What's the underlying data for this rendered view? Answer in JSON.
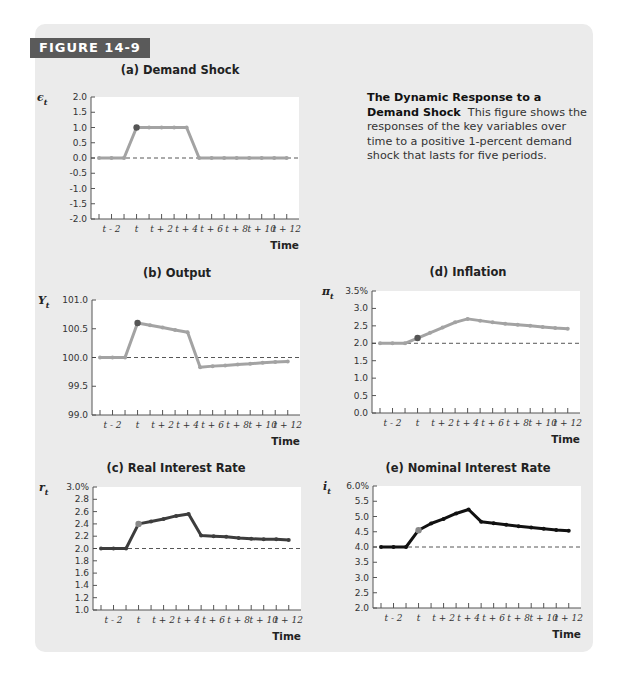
{
  "figure": {
    "label": "FIGURE 14-9",
    "caption_title": "The Dynamic Response to a Demand Shock",
    "caption_body": "This figure shows the responses of the key variables over time to a positive 1-percent demand shock that lasts for five periods."
  },
  "colors": {
    "panel_bg": "#ebebeb",
    "plot_bg": "#ffffff",
    "label_bg": "#5a5a5a",
    "light_series": "#a3a3a3",
    "mid_series": "#3d3d3d",
    "dark_series": "#111111",
    "shock_marker": "#555555"
  },
  "chart_data": [
    {
      "id": "a",
      "type": "line",
      "title": "(a) Demand Shock",
      "ylabel": "ε_t",
      "xlabel": "Time",
      "x": [
        -3,
        -2,
        -1,
        0,
        1,
        2,
        3,
        4,
        5,
        6,
        7,
        8,
        9,
        10,
        11,
        12
      ],
      "x_tick_labels": [
        "t - 2",
        "t",
        "t + 2",
        "t + 4",
        "t + 6",
        "t + 8",
        "t + 10",
        "t + 12"
      ],
      "y_ticks": [
        "2.0",
        "1.5",
        "1.0",
        "0.5",
        "0.0",
        "-0.5",
        "-1.0",
        "-1.5",
        "-2.0"
      ],
      "ylim": [
        -2.0,
        2.0
      ],
      "baseline": 0.0,
      "values": [
        0,
        0,
        0,
        1,
        1,
        1,
        1,
        1,
        0,
        0,
        0,
        0,
        0,
        0,
        0,
        0
      ],
      "style": "light"
    },
    {
      "id": "b",
      "type": "line",
      "title": "(b) Output",
      "ylabel": "Y_t",
      "xlabel": "Time",
      "x": [
        -3,
        -2,
        -1,
        0,
        1,
        2,
        3,
        4,
        5,
        6,
        7,
        8,
        9,
        10,
        11,
        12
      ],
      "x_tick_labels": [
        "t - 2",
        "t",
        "t + 2",
        "t + 4",
        "t + 6",
        "t + 8",
        "t + 10",
        "t + 12"
      ],
      "y_ticks": [
        "101.0",
        "100.5",
        "100.0",
        "99.5",
        "99.0"
      ],
      "ylim": [
        99.0,
        101.0
      ],
      "baseline": 100.0,
      "values": [
        100,
        100,
        100,
        100.6,
        100.56,
        100.52,
        100.48,
        100.44,
        99.83,
        99.85,
        99.86,
        99.88,
        99.89,
        99.91,
        99.92,
        99.93
      ],
      "style": "light"
    },
    {
      "id": "d",
      "type": "line",
      "title": "(d) Inflation",
      "ylabel": "π_t",
      "xlabel": "Time",
      "x": [
        -3,
        -2,
        -1,
        0,
        1,
        2,
        3,
        4,
        5,
        6,
        7,
        8,
        9,
        10,
        11,
        12
      ],
      "x_tick_labels": [
        "t - 2",
        "t",
        "t + 2",
        "t + 4",
        "t + 6",
        "t + 8",
        "t + 10",
        "t + 12"
      ],
      "y_ticks": [
        "3.5%",
        "3.0",
        "2.5",
        "2.0",
        "1.5",
        "1.0",
        "0.5",
        "0.0"
      ],
      "ylim": [
        0.0,
        3.5
      ],
      "baseline": 2.0,
      "values": [
        2.0,
        2.0,
        2.0,
        2.15,
        2.3,
        2.45,
        2.6,
        2.7,
        2.65,
        2.6,
        2.56,
        2.53,
        2.5,
        2.47,
        2.44,
        2.42
      ],
      "style": "light"
    },
    {
      "id": "c",
      "type": "line",
      "title": "(c) Real Interest Rate",
      "ylabel": "r_t",
      "xlabel": "Time",
      "x": [
        -3,
        -2,
        -1,
        0,
        1,
        2,
        3,
        4,
        5,
        6,
        7,
        8,
        9,
        10,
        11,
        12
      ],
      "x_tick_labels": [
        "t - 2",
        "t",
        "t + 2",
        "t + 4",
        "t + 6",
        "t + 8",
        "t + 10",
        "t + 12"
      ],
      "y_ticks": [
        "3.0%",
        "2.8",
        "2.6",
        "2.4",
        "2.2",
        "2.0",
        "1.8",
        "1.6",
        "1.4",
        "1.2",
        "1.0"
      ],
      "ylim": [
        1.0,
        3.0
      ],
      "baseline": 2.0,
      "values": [
        2.0,
        2.0,
        2.0,
        2.4,
        2.44,
        2.48,
        2.53,
        2.56,
        2.21,
        2.2,
        2.19,
        2.17,
        2.16,
        2.15,
        2.15,
        2.14
      ],
      "style": "mid"
    },
    {
      "id": "e",
      "type": "line",
      "title": "(e) Nominal Interest Rate",
      "ylabel": "i_t",
      "xlabel": "Time",
      "x": [
        -3,
        -2,
        -1,
        0,
        1,
        2,
        3,
        4,
        5,
        6,
        7,
        8,
        9,
        10,
        11,
        12
      ],
      "x_tick_labels": [
        "t - 2",
        "t",
        "t + 2",
        "t + 4",
        "t + 6",
        "t + 8",
        "t + 10",
        "t + 12"
      ],
      "y_ticks": [
        "6.0%",
        "5.5",
        "5.0",
        "4.5",
        "4.0",
        "3.5",
        "3.0",
        "2.5",
        "2.0"
      ],
      "ylim": [
        2.0,
        6.0
      ],
      "baseline": 4.0,
      "values": [
        4.0,
        4.0,
        4.0,
        4.55,
        4.77,
        4.92,
        5.1,
        5.23,
        4.83,
        4.78,
        4.73,
        4.68,
        4.64,
        4.6,
        4.56,
        4.53
      ],
      "style": "dark"
    }
  ],
  "layout": {
    "a": {
      "x0": 91,
      "y0": 97,
      "w": 208,
      "h": 122,
      "tx": 180,
      "ty": 74
    },
    "b": {
      "x0": 92,
      "y0": 300,
      "w": 208,
      "h": 115,
      "tx": 177,
      "ty": 277
    },
    "d": {
      "x0": 372,
      "y0": 291,
      "w": 208,
      "h": 122,
      "tx": 468,
      "ty": 276
    },
    "c": {
      "x0": 93,
      "y0": 487,
      "w": 208,
      "h": 123,
      "tx": 176,
      "ty": 472
    },
    "e": {
      "x0": 373,
      "y0": 486,
      "w": 208,
      "h": 122,
      "tx": 468,
      "ty": 472
    }
  }
}
